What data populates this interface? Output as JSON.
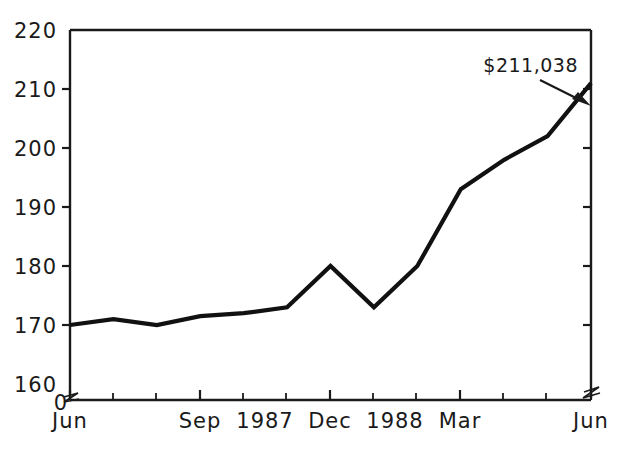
{
  "chart_data": {
    "type": "line",
    "title": "",
    "subtitle": "",
    "xlabel": "",
    "ylabel": "",
    "ylim": [
      160,
      220
    ],
    "y_ticks": [
      160,
      170,
      180,
      190,
      200,
      210,
      220
    ],
    "y_tick_labels": [
      "160",
      "170",
      "180",
      "190",
      "200",
      "210",
      "220"
    ],
    "zero_label": "0",
    "axis_break": true,
    "grid": false,
    "legend": "none",
    "x": [
      "Jun 1987",
      "Jul 1987",
      "Aug 1987",
      "Sep 1987",
      "Oct 1987",
      "Nov 1987",
      "Dec 1987",
      "Jan 1988",
      "Feb 1988",
      "Mar 1988",
      "Apr 1988",
      "May 1988",
      "Jun 1988"
    ],
    "x_tick_labels": [
      "Jun",
      "",
      "",
      "Sep",
      "",
      "1987",
      "Dec",
      "1988",
      "",
      "Mar",
      "",
      "",
      "Jun"
    ],
    "x_major_labels": [
      "Jun",
      "Sep",
      "1987",
      "Dec",
      "1988",
      "Mar",
      "Jun"
    ],
    "values": [
      170,
      171,
      170,
      171.5,
      172,
      173,
      180,
      173,
      180,
      193,
      198,
      202,
      211
    ],
    "series": [
      {
        "name": "Total assets",
        "values": [
          170,
          171,
          170,
          171.5,
          172,
          173,
          180,
          173,
          180,
          193,
          198,
          202,
          211
        ],
        "color": "#111111"
      }
    ],
    "annotations": [
      {
        "text": "$211,038",
        "points_to_x": "Jun 1988",
        "points_to_y": 211,
        "arrow": true
      }
    ]
  },
  "axis": {
    "y_labels": [
      "220",
      "210",
      "200",
      "190",
      "180",
      "170",
      "160"
    ],
    "zero": "0",
    "x_labels": [
      "Jun",
      "Sep",
      "1987",
      "Dec",
      "1988",
      "Mar",
      "Jun"
    ]
  },
  "annotation": {
    "value_label": "$211,038"
  },
  "colors": {
    "line": "#111111",
    "axis": "#1a1a1a",
    "background": "#ffffff"
  }
}
